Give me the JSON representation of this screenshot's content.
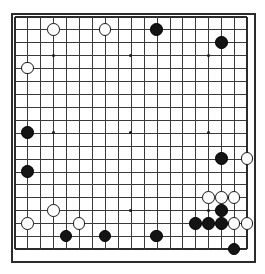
{
  "app": {
    "title": "Go Board Diagram",
    "background_color": "#ffffff"
  },
  "board": {
    "name": "go-board",
    "size": 19,
    "line_color": "#3a3a3a",
    "edge_color": "#2b2b2b",
    "board_color": "#ffffff",
    "origin_x": 14.5,
    "origin_y": 16.5,
    "spacing": 12.92,
    "stone_radius": 6.3,
    "star_radius": 1.5,
    "star_points": [
      [
        3,
        3
      ],
      [
        9,
        3
      ],
      [
        15,
        3
      ],
      [
        3,
        9
      ],
      [
        9,
        9
      ],
      [
        15,
        9
      ],
      [
        3,
        15
      ],
      [
        9,
        15
      ],
      [
        15,
        15
      ]
    ],
    "column_labels": [
      "A",
      "B",
      "C",
      "D",
      "E",
      "F",
      "G",
      "H",
      "J",
      "K",
      "L",
      "M",
      "N",
      "O",
      "P",
      "Q",
      "R",
      "S",
      "T"
    ],
    "row_labels": [
      "19",
      "18",
      "17",
      "16",
      "15",
      "14",
      "13",
      "12",
      "11",
      "10",
      "9",
      "8",
      "7",
      "6",
      "5",
      "4",
      "3",
      "2",
      "1"
    ]
  },
  "stones": {
    "black_color": "#141414",
    "white_color": "#fdfdfd",
    "black": [
      {
        "col": 11,
        "row": 1,
        "label": "M18"
      },
      {
        "col": 16,
        "row": 2,
        "label": "R17"
      },
      {
        "col": 1,
        "row": 9,
        "label": "B10"
      },
      {
        "col": 1,
        "row": 12,
        "label": "B7"
      },
      {
        "col": 16,
        "row": 11,
        "label": "R8"
      },
      {
        "col": 14,
        "row": 16,
        "label": "P3"
      },
      {
        "col": 15,
        "row": 16,
        "label": "Q3"
      },
      {
        "col": 16,
        "row": 15,
        "label": "R4"
      },
      {
        "col": 16,
        "row": 16,
        "label": "R3"
      },
      {
        "col": 4,
        "row": 17,
        "label": "E2"
      },
      {
        "col": 7,
        "row": 17,
        "label": "H2"
      },
      {
        "col": 11,
        "row": 17,
        "label": "M2"
      },
      {
        "col": 17,
        "row": 18,
        "label": "S1"
      }
    ],
    "white": [
      {
        "col": 3,
        "row": 1,
        "label": "D18"
      },
      {
        "col": 7,
        "row": 1,
        "label": "H18"
      },
      {
        "col": 1,
        "row": 4,
        "label": "B15"
      },
      {
        "col": 18,
        "row": 11,
        "label": "T8"
      },
      {
        "col": 15,
        "row": 14,
        "label": "Q5"
      },
      {
        "col": 16,
        "row": 14,
        "label": "R5"
      },
      {
        "col": 17,
        "row": 14,
        "label": "S5"
      },
      {
        "col": 3,
        "row": 15,
        "label": "D4"
      },
      {
        "col": 1,
        "row": 16,
        "label": "B3"
      },
      {
        "col": 5,
        "row": 16,
        "label": "F3"
      },
      {
        "col": 17,
        "row": 16,
        "label": "S3"
      },
      {
        "col": 18,
        "row": 16,
        "label": "T3"
      }
    ]
  },
  "geometry": {
    "frame_left": 11,
    "frame_top": 13,
    "frame_width": 245,
    "frame_height": 250
  }
}
